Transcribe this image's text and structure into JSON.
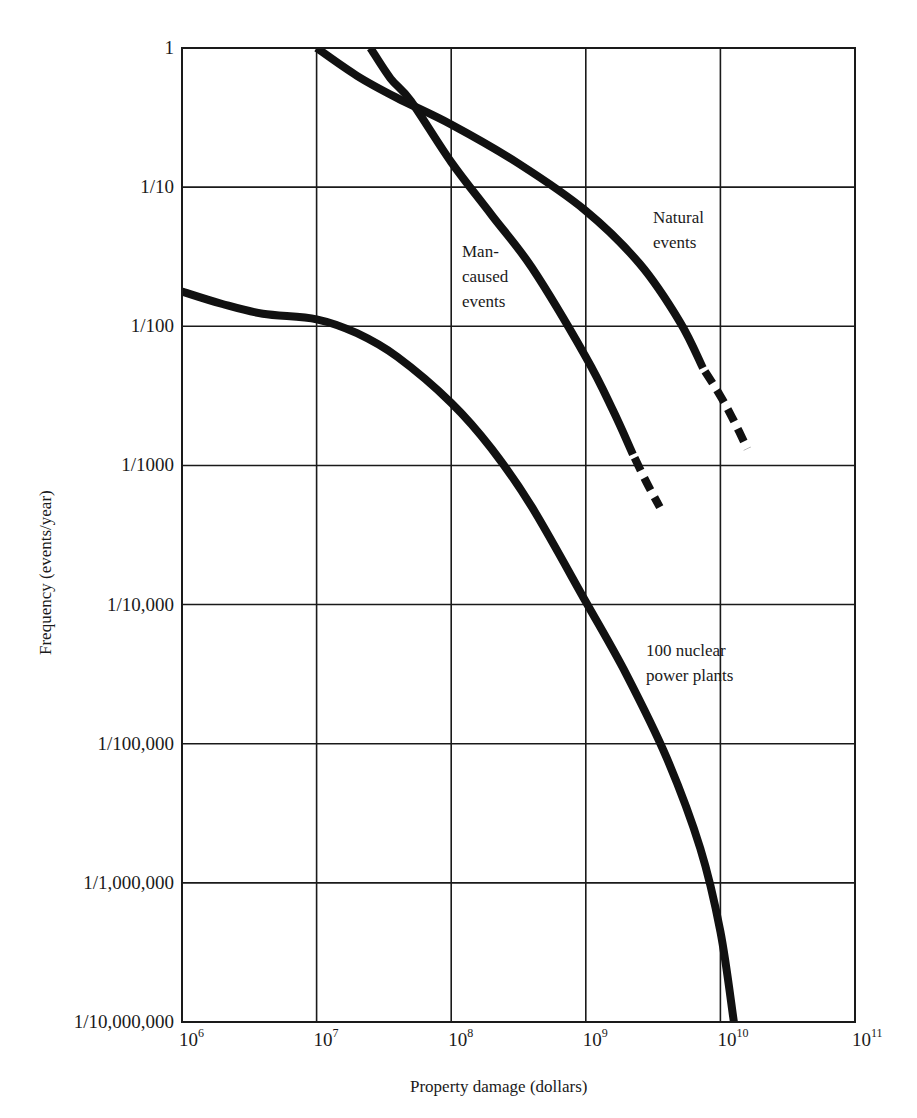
{
  "chart_data": {
    "type": "line",
    "title": "",
    "xlabel": "Property damage (dollars)",
    "ylabel": "Frequency (events/year)",
    "xscale": "log",
    "yscale": "log",
    "xlim": [
      1000000,
      100000000000
    ],
    "ylim": [
      1e-07,
      1
    ],
    "grid": true,
    "legend": "none (inline annotations)",
    "x_ticks": [
      {
        "base": "10",
        "exp": "6",
        "log": 6
      },
      {
        "base": "10",
        "exp": "7",
        "log": 7
      },
      {
        "base": "10",
        "exp": "8",
        "log": 8
      },
      {
        "base": "10",
        "exp": "9",
        "log": 9
      },
      {
        "base": "10",
        "exp": "10",
        "log": 10
      },
      {
        "base": "10",
        "exp": "11",
        "log": 11
      }
    ],
    "y_ticks": [
      {
        "label": "1",
        "log": 0
      },
      {
        "label": "1/10",
        "log": -1
      },
      {
        "label": "1/100",
        "log": -2
      },
      {
        "label": "1/1000",
        "log": -3
      },
      {
        "label": "1/10,000",
        "log": -4
      },
      {
        "label": "1/100,000",
        "log": -5
      },
      {
        "label": "1/1,000,000",
        "log": -6
      },
      {
        "label": "1/10,000,000",
        "log": -7
      }
    ],
    "series": [
      {
        "name": "Natural events",
        "annotation": "Natural\nevents",
        "log_points_solid": [
          [
            7.0,
            0.0
          ],
          [
            7.3,
            -0.2
          ],
          [
            7.6,
            -0.36
          ],
          [
            8.0,
            -0.55
          ],
          [
            8.5,
            -0.83
          ],
          [
            9.0,
            -1.17
          ],
          [
            9.4,
            -1.55
          ],
          [
            9.7,
            -1.97
          ],
          [
            9.87,
            -2.3
          ]
        ],
        "log_points_dashed": [
          [
            9.87,
            -2.3
          ],
          [
            10.0,
            -2.5
          ],
          [
            10.1,
            -2.68
          ],
          [
            10.2,
            -2.88
          ]
        ]
      },
      {
        "name": "Man-caused events",
        "annotation": "Man-\ncaused\nevents",
        "log_points_solid": [
          [
            7.4,
            0.0
          ],
          [
            7.55,
            -0.22
          ],
          [
            7.7,
            -0.38
          ],
          [
            8.0,
            -0.82
          ],
          [
            8.3,
            -1.2
          ],
          [
            8.6,
            -1.58
          ],
          [
            9.0,
            -2.22
          ],
          [
            9.2,
            -2.6
          ],
          [
            9.35,
            -2.92
          ]
        ],
        "log_points_dashed": [
          [
            9.35,
            -2.92
          ],
          [
            9.45,
            -3.12
          ],
          [
            9.55,
            -3.3
          ]
        ]
      },
      {
        "name": "100 nuclear power plants",
        "annotation": "100 nuclear\npower plants",
        "log_points_solid": [
          [
            6.0,
            -1.75
          ],
          [
            6.3,
            -1.84
          ],
          [
            6.6,
            -1.91
          ],
          [
            7.0,
            -1.95
          ],
          [
            7.3,
            -2.05
          ],
          [
            7.6,
            -2.22
          ],
          [
            8.0,
            -2.55
          ],
          [
            8.3,
            -2.88
          ],
          [
            8.6,
            -3.3
          ],
          [
            9.0,
            -3.98
          ],
          [
            9.3,
            -4.5
          ],
          [
            9.6,
            -5.1
          ],
          [
            9.85,
            -5.75
          ],
          [
            10.0,
            -6.35
          ],
          [
            10.1,
            -7.0
          ]
        ],
        "log_points_dashed": []
      }
    ]
  },
  "annotations": {
    "natural": "Natural\nevents",
    "man_caused": "Man-\ncaused\nevents",
    "nuclear": "100 nuclear\npower plants"
  },
  "colors": {
    "line": "#111111",
    "grid": "#1a1a1a",
    "background": "#ffffff"
  }
}
